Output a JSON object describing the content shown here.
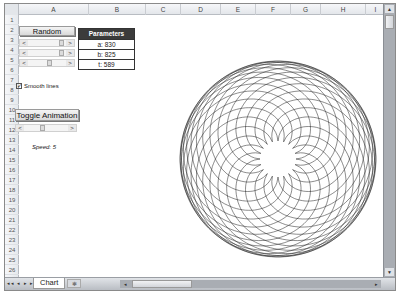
{
  "columns": [
    "A",
    "B",
    "C",
    "D",
    "E",
    "F",
    "G",
    "H",
    "I"
  ],
  "rows": [
    "1",
    "2",
    "3",
    "4",
    "5",
    "6",
    "7",
    "8",
    "9",
    "10",
    "11",
    "12",
    "13",
    "14",
    "15",
    "16",
    "17",
    "18",
    "19",
    "20",
    "21",
    "22",
    "23",
    "24",
    "25",
    "26"
  ],
  "controls": {
    "random_button": "Random",
    "toggle_animation_button": "Toggle Animation",
    "smooth_lines_label": "Smooth lines",
    "smooth_lines_checked": true,
    "speed_label": "Speed: 5",
    "scrollbar_left_arrow": "<",
    "scrollbar_right_arrow": ">"
  },
  "parameters": {
    "header": "Parameters",
    "a": "a: 830",
    "b": "b: 825",
    "t": "t: 589"
  },
  "chart": {
    "type": "spirograph",
    "line_color": "#1a1a1a"
  },
  "sheet_tabs": {
    "active": "Chart",
    "nav_arrows": "◂◂ ◂ ▸ ▸▸"
  }
}
